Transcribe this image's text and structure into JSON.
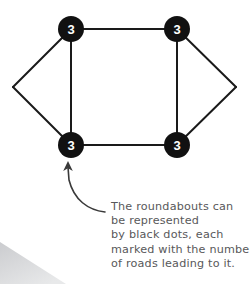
{
  "diagram": {
    "node_fill": "#111111",
    "node_label_color": "#ffffff",
    "edge_color": "#1a1a1a",
    "nodes": [
      {
        "id": "top-left",
        "label": "3",
        "cx": 71,
        "cy": 29,
        "r": 13
      },
      {
        "id": "top-right",
        "label": "3",
        "cx": 177,
        "cy": 29,
        "r": 13
      },
      {
        "id": "bottom-left",
        "label": "3",
        "cx": 71,
        "cy": 145,
        "r": 13
      },
      {
        "id": "bottom-right",
        "label": "3",
        "cx": 177,
        "cy": 145,
        "r": 13
      }
    ],
    "apexes": [
      {
        "id": "left-apex",
        "x": 13,
        "y": 87
      },
      {
        "id": "right-apex",
        "x": 236,
        "y": 87
      }
    ],
    "edges": [
      {
        "id": "edge-top",
        "from": "top-left",
        "to": "top-right"
      },
      {
        "id": "edge-left-vertical",
        "from": "top-left",
        "to": "bottom-left"
      },
      {
        "id": "edge-right-vertical",
        "from": "top-right",
        "to": "bottom-right"
      },
      {
        "id": "edge-bottom",
        "from": "bottom-left",
        "to": "bottom-right"
      },
      {
        "id": "edge-left-upper",
        "from": "top-left",
        "to": "left-apex"
      },
      {
        "id": "edge-left-lower",
        "from": "left-apex",
        "to": "bottom-left"
      },
      {
        "id": "edge-right-upper",
        "from": "top-right",
        "to": "right-apex"
      },
      {
        "id": "edge-right-lower",
        "from": "right-apex",
        "to": "bottom-right"
      }
    ]
  },
  "annotation": {
    "arrow_color": "#3a3a3a",
    "target_node": "bottom-left",
    "lines": [
      "The roundabouts can",
      "be represented",
      "by black dots, each",
      "marked with the number",
      "of roads leading to it."
    ]
  },
  "corner_shadow": {
    "color": "#d2d3d5"
  }
}
